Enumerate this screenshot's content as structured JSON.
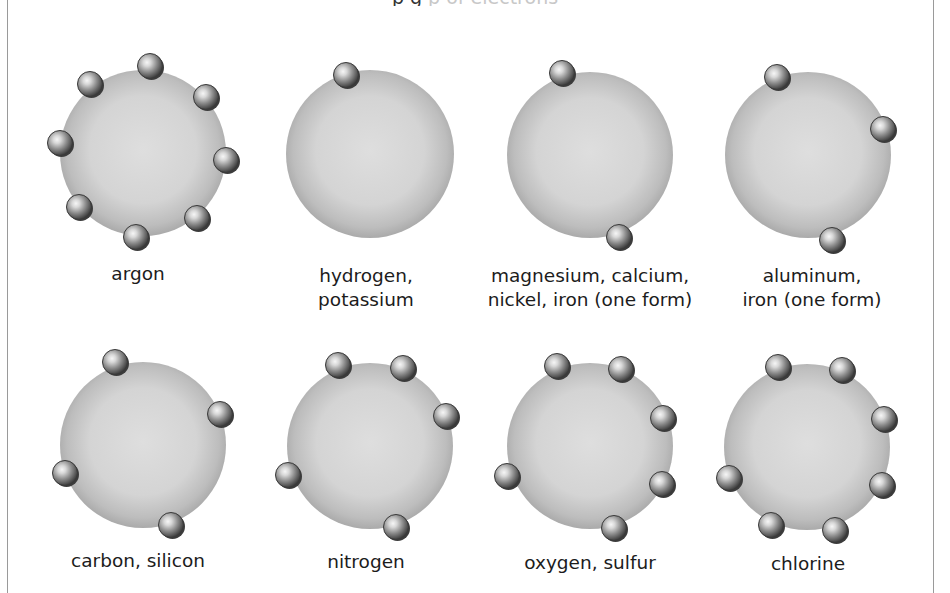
{
  "caption": {
    "text_dark": "                              p           g",
    "text_faded": "                p              of electrons"
  },
  "colors": {
    "nucleus_center": "#dcdcdc",
    "nucleus_edge": "#a9a9a9",
    "electron_highlight": "#f4f4f4",
    "electron_mid": "#8c8c8c",
    "electron_dark": "#3a3a3a",
    "frame": "#9a9a9a"
  },
  "atoms": [
    {
      "id": "argon",
      "label_lines": [
        "argon"
      ],
      "cx": 143,
      "cy": 153,
      "r": 83,
      "electron_count": 8,
      "electrons": [
        [
          150,
          66
        ],
        [
          90,
          84
        ],
        [
          206,
          97
        ],
        [
          60,
          143
        ],
        [
          226,
          160
        ],
        [
          79,
          207
        ],
        [
          197,
          218
        ],
        [
          136,
          237
        ]
      ],
      "label_x": 138,
      "label_y": 262
    },
    {
      "id": "hydrogen-potassium",
      "label_lines": [
        "hydrogen,",
        "potassium"
      ],
      "cx": 370,
      "cy": 154,
      "r": 84,
      "electron_count": 1,
      "electrons": [
        [
          346,
          75
        ]
      ],
      "label_x": 366,
      "label_y": 264
    },
    {
      "id": "magnesium-calcium-nickel-iron",
      "label_lines": [
        "magnesium, calcium,",
        "nickel, iron (one form)"
      ],
      "cx": 590,
      "cy": 155,
      "r": 83,
      "electron_count": 2,
      "electrons": [
        [
          562,
          73
        ],
        [
          619,
          237
        ]
      ],
      "label_x": 590,
      "label_y": 264
    },
    {
      "id": "aluminum-iron",
      "label_lines": [
        "aluminum,",
        "iron (one form)"
      ],
      "cx": 808,
      "cy": 155,
      "r": 83,
      "electron_count": 3,
      "electrons": [
        [
          777,
          77
        ],
        [
          883,
          129
        ],
        [
          832,
          240
        ]
      ],
      "label_x": 812,
      "label_y": 264
    },
    {
      "id": "carbon-silicon",
      "label_lines": [
        "carbon, silicon"
      ],
      "cx": 143,
      "cy": 445,
      "r": 83,
      "electron_count": 4,
      "electrons": [
        [
          115,
          362
        ],
        [
          220,
          414
        ],
        [
          65,
          473
        ],
        [
          171,
          525
        ]
      ],
      "label_x": 138,
      "label_y": 549
    },
    {
      "id": "nitrogen",
      "label_lines": [
        "nitrogen"
      ],
      "cx": 370,
      "cy": 446,
      "r": 83,
      "electron_count": 5,
      "electrons": [
        [
          338,
          365
        ],
        [
          403,
          368
        ],
        [
          446,
          416
        ],
        [
          288,
          475
        ],
        [
          396,
          527
        ]
      ],
      "label_x": 366,
      "label_y": 550
    },
    {
      "id": "oxygen-sulfur",
      "label_lines": [
        "oxygen, sulfur"
      ],
      "cx": 590,
      "cy": 446,
      "r": 83,
      "electron_count": 6,
      "electrons": [
        [
          557,
          366
        ],
        [
          621,
          369
        ],
        [
          663,
          418
        ],
        [
          507,
          476
        ],
        [
          662,
          484
        ],
        [
          614,
          528
        ]
      ],
      "label_x": 590,
      "label_y": 551
    },
    {
      "id": "chlorine",
      "label_lines": [
        "chlorine"
      ],
      "cx": 807,
      "cy": 447,
      "r": 83,
      "electron_count": 7,
      "electrons": [
        [
          778,
          367
        ],
        [
          842,
          370
        ],
        [
          884,
          419
        ],
        [
          729,
          478
        ],
        [
          882,
          485
        ],
        [
          771,
          525
        ],
        [
          835,
          530
        ]
      ],
      "label_x": 808,
      "label_y": 552
    }
  ]
}
